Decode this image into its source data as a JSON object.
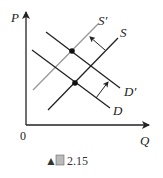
{
  "figure": {
    "caption_marker": "▲",
    "caption_label": "圖",
    "caption_number": "2.15"
  },
  "axes": {
    "y_label": "P",
    "x_label": "Q",
    "origin_label": "0"
  },
  "curves": {
    "s_prime": {
      "label": "S′",
      "color": "#999999"
    },
    "s": {
      "label": "S",
      "color": "#222222"
    },
    "d_prime": {
      "label": "D′",
      "color": "#222222"
    },
    "d": {
      "label": "D",
      "color": "#222222"
    }
  },
  "colors": {
    "axis": "#222222",
    "supply_shifted": "#999999",
    "line": "#222222"
  }
}
